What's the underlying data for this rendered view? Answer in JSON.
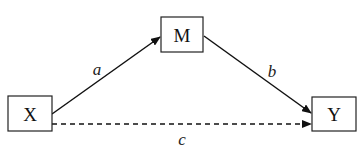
{
  "diagram": {
    "type": "mediation-path-diagram",
    "nodes": [
      {
        "id": "X",
        "label": "X",
        "x": 8,
        "y": 96,
        "w": 44,
        "h": 35
      },
      {
        "id": "M",
        "label": "M",
        "x": 161,
        "y": 17,
        "w": 42,
        "h": 35
      },
      {
        "id": "Y",
        "label": "Y",
        "x": 312,
        "y": 97,
        "w": 44,
        "h": 34
      }
    ],
    "edges": [
      {
        "id": "a",
        "from": "X",
        "to": "M",
        "label": "a",
        "style": "solid"
      },
      {
        "id": "b",
        "from": "M",
        "to": "Y",
        "label": "b",
        "style": "solid"
      },
      {
        "id": "c",
        "from": "X",
        "to": "Y",
        "label": "c",
        "style": "dashed"
      }
    ],
    "colors": {
      "line": "#111111",
      "box_border": "#222222",
      "background": "#ffffff"
    }
  }
}
